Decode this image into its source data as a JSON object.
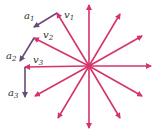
{
  "diagram": {
    "title": "",
    "colors": {
      "velocity": "#d6336c",
      "acceleration": "#6b4a7a",
      "label": "#333333",
      "background": "#ffffff"
    },
    "center": [
      89,
      66
    ],
    "radius": 61,
    "spokes": [
      {
        "angle_deg": 90,
        "tip": [
          89,
          5
        ]
      },
      {
        "angle_deg": 60,
        "tip": [
          120,
          14
        ]
      },
      {
        "angle_deg": 30,
        "tip": [
          142,
          36
        ]
      },
      {
        "angle_deg": 0,
        "tip": [
          151,
          66
        ]
      },
      {
        "angle_deg": -30,
        "tip": [
          142,
          96
        ]
      },
      {
        "angle_deg": -60,
        "tip": [
          120,
          118
        ]
      },
      {
        "angle_deg": -90,
        "tip": [
          89,
          128
        ]
      },
      {
        "angle_deg": -120,
        "tip": [
          58,
          118
        ]
      },
      {
        "angle_deg": -150,
        "tip": [
          35,
          96
        ]
      },
      {
        "angle_deg": 180,
        "tip": [
          25,
          67
        ],
        "label": "v3"
      },
      {
        "angle_deg": 150,
        "tip": [
          34,
          38
        ],
        "label": "v2"
      },
      {
        "angle_deg": 120,
        "tip": [
          57,
          13
        ],
        "label": "v1"
      }
    ],
    "accelerations": [
      {
        "label": "a1",
        "from": [
          57,
          13
        ],
        "to": [
          34,
          27
        ]
      },
      {
        "label": "a2",
        "from": [
          34,
          38
        ],
        "to": [
          20,
          61
        ]
      },
      {
        "label": "a3",
        "from": [
          25,
          67
        ],
        "to": [
          25,
          97
        ]
      }
    ],
    "labels": {
      "v1": {
        "base": "v",
        "sub": "1"
      },
      "v2": {
        "base": "v",
        "sub": "2"
      },
      "v3": {
        "base": "v",
        "sub": "3"
      },
      "a1": {
        "base": "a",
        "sub": "1"
      },
      "a2": {
        "base": "a",
        "sub": "2"
      },
      "a3": {
        "base": "a",
        "sub": "3"
      }
    }
  }
}
